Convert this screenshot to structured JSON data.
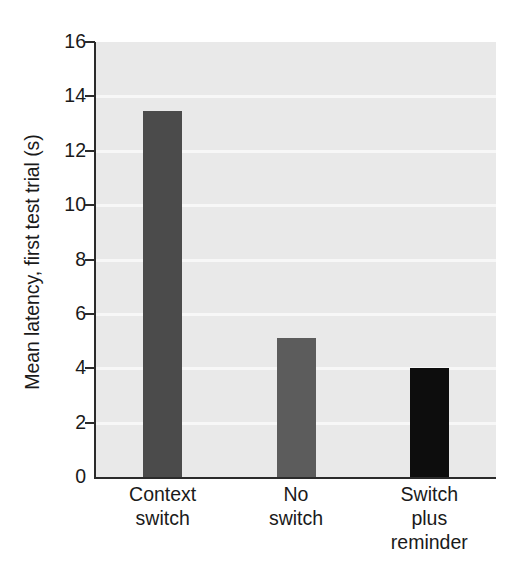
{
  "chart_data": {
    "type": "bar",
    "title": "",
    "subtitle": "",
    "xlabel": "",
    "ylabel": "Mean latency, first test trial (s)",
    "categories": [
      "Context switch",
      "No switch",
      "Switch plus reminder"
    ],
    "category_lines": [
      [
        "Context",
        "switch"
      ],
      [
        "No",
        "switch"
      ],
      [
        "Switch",
        "plus",
        "reminder"
      ]
    ],
    "values": [
      13.45,
      5.1,
      4.0
    ],
    "bar_colors": [
      "#4b4b4b",
      "#5c5c5c",
      "#0d0d0d"
    ],
    "ylim": [
      0,
      16
    ],
    "yticks": [
      0,
      2,
      4,
      6,
      8,
      10,
      12,
      14,
      16
    ],
    "ytick_labels": [
      "0",
      "2",
      "4",
      "6",
      "8",
      "10",
      "12",
      "14",
      "16"
    ],
    "grid": true,
    "grid_color": "#f7f7f7",
    "plot_background": "#e9e9e9",
    "figure_background": "#ffffff",
    "axis_color": "#2b2b2b",
    "legend": null,
    "legend_position": "none",
    "annotations": []
  }
}
